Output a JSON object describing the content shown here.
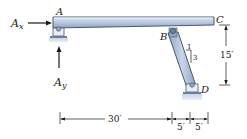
{
  "diagram": {
    "points": {
      "A": "A",
      "B": "B",
      "C": "C",
      "D": "D"
    },
    "reactions": {
      "Ax_main": "A",
      "Ax_sub": "x",
      "Ay_main": "A",
      "Ay_sub": "y"
    },
    "slope": {
      "rise_label": "1",
      "run_label": "3"
    },
    "dimensions": {
      "horizontal_1": "30′",
      "horizontal_2": "5′",
      "horizontal_3": "5′",
      "vertical": "15′"
    },
    "colors": {
      "member_fill": "#b8c8de",
      "member_edge": "#4a5a72",
      "member_highlight": "#dfe7f1",
      "support_fill": "#c9d6e6",
      "line": "#1a1a1a"
    }
  }
}
